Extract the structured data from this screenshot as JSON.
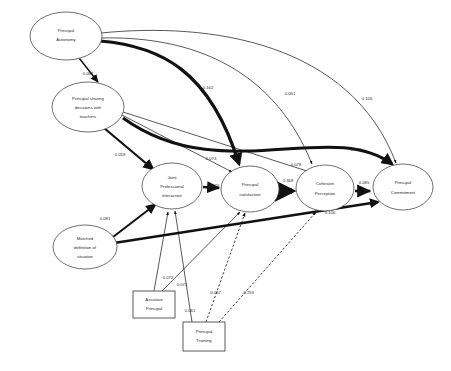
{
  "diagram": {
    "type": "path-diagram",
    "nodes": [
      {
        "id": "principal_autonomy",
        "label_lines": [
          "Principal",
          "Autonomy"
        ],
        "shape": "ellipse",
        "cx": 66,
        "cy": 36,
        "rx": 36,
        "ry": 24
      },
      {
        "id": "principal_sharing",
        "label_lines": [
          "Principal sharing",
          "decisions with",
          "teachers"
        ],
        "shape": "ellipse",
        "cx": 88,
        "cy": 107,
        "rx": 36,
        "ry": 25
      },
      {
        "id": "joint_professional",
        "label_lines": [
          "Joint",
          "Professional",
          "interaction"
        ],
        "shape": "ellipse",
        "cx": 172,
        "cy": 186,
        "rx": 30,
        "ry": 23
      },
      {
        "id": "principal_satisfaction",
        "label_lines": [
          "Principal",
          "satisfaction"
        ],
        "shape": "ellipse",
        "cx": 250,
        "cy": 189,
        "rx": 29,
        "ry": 23
      },
      {
        "id": "cohesion_perception",
        "label_lines": [
          "Cohesion",
          "Perception"
        ],
        "shape": "ellipse",
        "cx": 325,
        "cy": 188,
        "rx": 29,
        "ry": 23
      },
      {
        "id": "principal_commitment",
        "label_lines": [
          "Principal",
          "Commitment"
        ],
        "shape": "ellipse",
        "cx": 403,
        "cy": 187,
        "rx": 30,
        "ry": 23
      },
      {
        "id": "matched_definition",
        "label_lines": [
          "Matched",
          "definition of",
          "situation"
        ],
        "shape": "ellipse",
        "cx": 85,
        "cy": 247,
        "rx": 32,
        "ry": 22
      },
      {
        "id": "assistant_principal",
        "label_lines": [
          "Assistant",
          "Principal"
        ],
        "shape": "rect",
        "x": 133,
        "y": 291,
        "w": 42,
        "h": 27
      },
      {
        "id": "principal_training",
        "label_lines": [
          "Principal",
          "Training"
        ],
        "shape": "rect",
        "x": 183,
        "y": 322,
        "w": 42,
        "h": 29
      }
    ],
    "coefficients": [
      {
        "id": "c_autonomy_sharing",
        "value": "0.087",
        "x": 88,
        "y": 74,
        "from": "principal_autonomy",
        "to": "principal_sharing"
      },
      {
        "id": "c_autonomy_satisfaction",
        "value": "0.162",
        "x": 208,
        "y": 88,
        "from": "principal_autonomy",
        "to": "principal_satisfaction"
      },
      {
        "id": "c_autonomy_cohesion",
        "value": "0.051",
        "x": 290,
        "y": 94,
        "from": "principal_autonomy",
        "to": "cohesion_perception"
      },
      {
        "id": "c_autonomy_commitment",
        "value": "0.106",
        "x": 367,
        "y": 99,
        "from": "principal_autonomy",
        "to": "principal_commitment"
      },
      {
        "id": "c_sharing_joint",
        "value": "0.059",
        "x": 120,
        "y": 155,
        "from": "principal_sharing",
        "to": "joint_professional"
      },
      {
        "id": "c_sharing_satisfaction",
        "value": "0.073",
        "x": 211,
        "y": 159,
        "from": "principal_sharing",
        "to": "principal_satisfaction"
      },
      {
        "id": "c_sharing_cohesion",
        "value": "0.078",
        "x": 296,
        "y": 165,
        "from": "principal_sharing",
        "to": "cohesion_perception"
      },
      {
        "id": "c_sharing_commitment",
        "value": "0.273",
        "x": 356,
        "y": 150,
        "from": "principal_sharing",
        "to": "principal_commitment"
      },
      {
        "id": "c_joint_satisfaction",
        "value": "0.076",
        "x": 214,
        "y": 186,
        "from": "joint_professional",
        "to": "principal_satisfaction"
      },
      {
        "id": "c_satisfaction_cohesion",
        "value": "0.368",
        "x": 288,
        "y": 181,
        "from": "principal_satisfaction",
        "to": "cohesion_perception"
      },
      {
        "id": "c_cohesion_commitment",
        "value": "0.085",
        "x": 364,
        "y": 183,
        "from": "cohesion_perception",
        "to": "principal_commitment"
      },
      {
        "id": "c_matched_commitment",
        "value": "0.106",
        "x": 330,
        "y": 213,
        "from": "matched_definition",
        "to": "principal_commitment"
      },
      {
        "id": "c_matched_joint",
        "value": "0.081",
        "x": 105,
        "y": 219,
        "from": "matched_definition",
        "to": "joint_professional"
      },
      {
        "id": "c_assistant_joint",
        "value": "0.072",
        "x": 168,
        "y": 278,
        "from": "assistant_principal",
        "to": "joint_professional"
      },
      {
        "id": "c_assistant_satisfaction",
        "value": "0.071",
        "x": 182,
        "y": 285,
        "from": "assistant_principal",
        "to": "principal_satisfaction"
      },
      {
        "id": "c_training_joint",
        "value": "0.061",
        "x": 190,
        "y": 311,
        "from": "principal_training",
        "to": "joint_professional"
      },
      {
        "id": "c_training_satisfaction",
        "value": "-0.057",
        "x": 215,
        "y": 293,
        "from": "principal_training",
        "to": "principal_satisfaction"
      },
      {
        "id": "c_training_cohesion",
        "value": "-0.253",
        "x": 248,
        "y": 293,
        "from": "principal_training",
        "to": "cohesion_perception"
      }
    ]
  }
}
